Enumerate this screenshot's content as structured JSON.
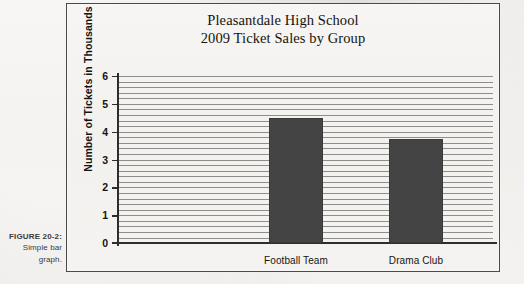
{
  "caption": {
    "figure_number": "FIGURE 20-2:",
    "description": "Simple bar graph."
  },
  "chart_data": {
    "type": "bar",
    "title": "Pleasantdale High School 2009 Ticket Sales by Group",
    "title_line1": "Pleasantdale High School",
    "title_line2": "2009 Ticket Sales by Group",
    "xlabel": "",
    "ylabel": "Number of Tickets in Thousands",
    "categories": [
      "Football Team",
      "Drama Club",
      "Glee Club"
    ],
    "values": [
      4.5,
      3.75,
      5.05
    ],
    "ylim": [
      0,
      6
    ],
    "ytick_labels": [
      "6",
      "5",
      "4",
      "3",
      "2",
      "1",
      "0"
    ],
    "ytick_values": [
      6,
      5,
      4,
      3,
      2,
      1,
      0
    ],
    "grid": true,
    "grid_orientation": "horizontal",
    "legend": false,
    "bar_color": "#444444",
    "axis_color": "#2d2d2d",
    "grid_color": "#8d8d8d"
  }
}
